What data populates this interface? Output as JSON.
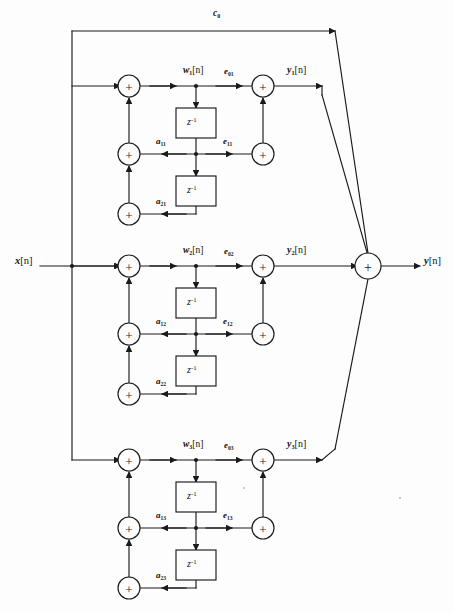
{
  "diagram": {
    "type": "signal-flow-graph",
    "io": {
      "input_label": "x",
      "input_index": "[n]",
      "output_label": "y",
      "output_index": "[n]"
    },
    "feedforward_gain": {
      "label": "c",
      "sub": "0"
    },
    "delay_label": {
      "base": "z",
      "exponent": "-1"
    },
    "adder_glyph": "+",
    "sections": [
      {
        "id": "section-1",
        "w": {
          "base": "w",
          "sub": "1",
          "index": "[n]"
        },
        "e0": {
          "base": "e",
          "sub": "01"
        },
        "e1": {
          "base": "e",
          "sub": "11"
        },
        "a1": {
          "base": "a",
          "sub": "11"
        },
        "a2": {
          "base": "a",
          "sub": "21"
        },
        "y": {
          "base": "y",
          "sub": "1",
          "index": "[n]"
        }
      },
      {
        "id": "section-2",
        "w": {
          "base": "w",
          "sub": "2",
          "index": "[n]"
        },
        "e0": {
          "base": "e",
          "sub": "02"
        },
        "e1": {
          "base": "e",
          "sub": "12"
        },
        "a1": {
          "base": "a",
          "sub": "12"
        },
        "a2": {
          "base": "a",
          "sub": "22"
        },
        "y": {
          "base": "y",
          "sub": "2",
          "index": "[n]"
        }
      },
      {
        "id": "section-3",
        "w": {
          "base": "w",
          "sub": "3",
          "index": "[n]"
        },
        "e0": {
          "base": "e",
          "sub": "03"
        },
        "e1": {
          "base": "e",
          "sub": "13"
        },
        "a1": {
          "base": "a",
          "sub": "13"
        },
        "a2": {
          "base": "a",
          "sub": "23"
        },
        "y": {
          "base": "y",
          "sub": "3",
          "index": "[n]"
        }
      }
    ],
    "colors": {
      "line": "#1a1a1a",
      "background": "#fdfdfd",
      "text": "#111111"
    }
  }
}
